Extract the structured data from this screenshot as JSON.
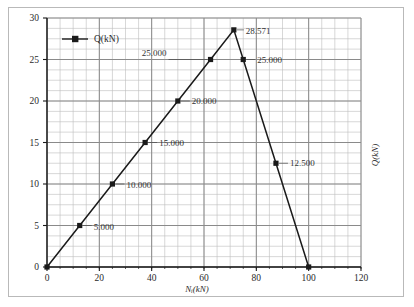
{
  "chart_data": {
    "type": "line",
    "title": "",
    "xlabel": "Nᵢ(kN)",
    "ylabel": "Q(kN)",
    "xlim": [
      0,
      120
    ],
    "ylim": [
      0,
      30
    ],
    "xticks": [
      "0",
      "20",
      "40",
      "60",
      "80",
      "100",
      "120"
    ],
    "xtick_values": [
      0,
      20,
      40,
      60,
      80,
      100,
      120
    ],
    "yticks": [
      "0",
      "5",
      "10",
      "15",
      "20",
      "25",
      "30"
    ],
    "ytick_values": [
      0,
      5,
      10,
      15,
      20,
      25,
      30
    ],
    "x_minor_step": 5,
    "y_minor_step": 1.25,
    "grid": true,
    "legend_position": "top-left",
    "series": [
      {
        "name": "Q(kN)",
        "marker": "square",
        "color": "#1a1a1a",
        "x": [
          0,
          12.5,
          25,
          37.5,
          50,
          62.5,
          71.4,
          75,
          87.5,
          100
        ],
        "y": [
          0,
          5,
          10,
          15,
          20,
          25,
          28.571,
          25,
          12.5,
          0
        ]
      }
    ],
    "point_labels": [
      {
        "text": "5.000",
        "x": 12.5,
        "y": 5,
        "dx": 14,
        "dy": 4
      },
      {
        "text": "10.000",
        "x": 25,
        "y": 10,
        "dx": 14,
        "dy": 4
      },
      {
        "text": "15.000",
        "x": 37.5,
        "y": 15,
        "dx": 14,
        "dy": 3
      },
      {
        "text": "20.000",
        "x": 50,
        "y": 20,
        "dx": 14,
        "dy": 3
      },
      {
        "text": "25.000",
        "x": 62.5,
        "y": 25,
        "dx": -44,
        "dy": -4
      },
      {
        "text": "28.571",
        "x": 71.4,
        "y": 28.571,
        "dx": 12,
        "dy": 4
      },
      {
        "text": "25.000",
        "x": 75,
        "y": 25,
        "dx": 14,
        "dy": 3
      },
      {
        "text": "12.500",
        "x": 87.5,
        "y": 12.5,
        "dx": 14,
        "dy": 3
      }
    ],
    "legend": {
      "label": "Q(kN)",
      "marker_color": "#1a1a1a"
    },
    "colors": {
      "line": "#1a1a1a",
      "major_grid": "#8a8a8a",
      "minor_grid": "#bdbdbd",
      "axis": "#1a1a1a",
      "frame": "#b9b9b9",
      "background": "#ffffff"
    }
  }
}
